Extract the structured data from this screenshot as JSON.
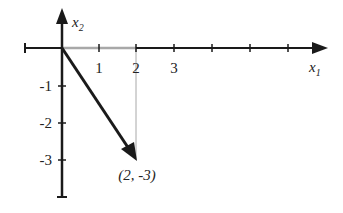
{
  "diagram": {
    "type": "vector-plot",
    "x_axis": {
      "label": "x",
      "label_sub": "1",
      "tick_labels": [
        "1",
        "2",
        "3"
      ],
      "range": [
        -1,
        7
      ]
    },
    "y_axis": {
      "label": "x",
      "label_sub": "2",
      "tick_labels": [
        "-1",
        "-2",
        "-3"
      ],
      "range": [
        -4,
        1
      ]
    },
    "vector": {
      "from": [
        0,
        0
      ],
      "to": [
        2,
        -3
      ],
      "label": "(2, -3)"
    },
    "colors": {
      "axis": "#1a1a1a",
      "vector": "#1a1a1a",
      "guide": "#a8a8a8"
    }
  }
}
